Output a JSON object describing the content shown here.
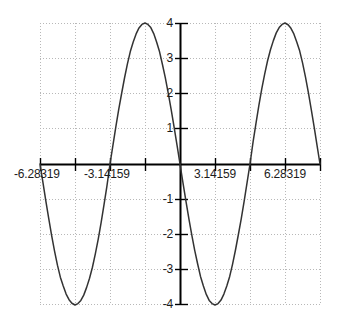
{
  "chart_data": {
    "type": "line",
    "title": "",
    "subtitle": "",
    "xlabel": "",
    "ylabel": "",
    "function": "y = -4 sin(x)",
    "xlim": [
      -6.28319,
      6.28319
    ],
    "ylim": [
      -4,
      4
    ],
    "grid": true,
    "grid_style": "dotted",
    "legend": "none",
    "x_tick_labels": [
      "-6.28319",
      "-3.14159",
      "3.14159",
      "6.28319"
    ],
    "x_tick_values": [
      -6.28319,
      -3.14159,
      3.14159,
      6.28319
    ],
    "x_gridline_values": [
      -6.28319,
      -4.712388,
      -3.14159,
      -1.570796,
      0,
      1.570796,
      3.14159,
      4.712388,
      6.28319
    ],
    "y_tick_labels": [
      "4",
      "3",
      "2",
      "1",
      "-1",
      "-2",
      "-3",
      "-4"
    ],
    "y_tick_values": [
      4,
      3,
      2,
      1,
      -1,
      -2,
      -3,
      -4
    ],
    "y_gridline_values": [
      4,
      3,
      2,
      1,
      0,
      -1,
      -2,
      -3,
      -4
    ],
    "series": [
      {
        "name": "-4 sin(x)",
        "color": "#333333",
        "points": [
          [
            -6.28319,
            0.0
          ],
          [
            -6.15,
            -0.53
          ],
          [
            -6.02,
            -1.05
          ],
          [
            -5.89,
            -1.55
          ],
          [
            -5.76,
            -2.03
          ],
          [
            -5.63,
            -2.47
          ],
          [
            -5.5,
            -2.87
          ],
          [
            -5.37,
            -3.21
          ],
          [
            -5.24,
            -3.46
          ],
          [
            -5.11,
            -3.69
          ],
          [
            -4.98,
            -3.85
          ],
          [
            -4.85,
            -3.95
          ],
          [
            -4.712388,
            -4.0
          ],
          [
            -4.58,
            -3.96
          ],
          [
            -4.45,
            -3.87
          ],
          [
            -4.32,
            -3.72
          ],
          [
            -4.19,
            -3.5
          ],
          [
            -4.06,
            -3.24
          ],
          [
            -3.93,
            -2.93
          ],
          [
            -3.8,
            -2.55
          ],
          [
            -3.67,
            -2.13
          ],
          [
            -3.54,
            -1.66
          ],
          [
            -3.41,
            -1.15
          ],
          [
            -3.28,
            -0.63
          ],
          [
            -3.14159,
            0.0
          ],
          [
            -3.01,
            0.53
          ],
          [
            -2.88,
            1.05
          ],
          [
            -2.75,
            1.55
          ],
          [
            -2.62,
            2.0
          ],
          [
            -2.49,
            2.44
          ],
          [
            -2.36,
            2.84
          ],
          [
            -2.23,
            3.19
          ],
          [
            -2.1,
            3.46
          ],
          [
            -1.97,
            3.69
          ],
          [
            -1.84,
            3.86
          ],
          [
            -1.71,
            3.96
          ],
          [
            -1.570796,
            4.0
          ],
          [
            -1.44,
            3.96
          ],
          [
            -1.31,
            3.87
          ],
          [
            -1.18,
            3.7
          ],
          [
            -1.05,
            3.46
          ],
          [
            -0.92,
            3.19
          ],
          [
            -0.79,
            2.83
          ],
          [
            -0.66,
            2.45
          ],
          [
            -0.53,
            2.02
          ],
          [
            -0.4,
            1.56
          ],
          [
            -0.27,
            1.07
          ],
          [
            -0.13,
            0.52
          ],
          [
            0.0,
            0.0
          ],
          [
            0.13,
            -0.52
          ],
          [
            0.27,
            -1.07
          ],
          [
            0.4,
            -1.56
          ],
          [
            0.53,
            -2.02
          ],
          [
            0.66,
            -2.45
          ],
          [
            0.79,
            -2.83
          ],
          [
            0.92,
            -3.19
          ],
          [
            1.05,
            -3.46
          ],
          [
            1.18,
            -3.7
          ],
          [
            1.31,
            -3.87
          ],
          [
            1.44,
            -3.96
          ],
          [
            1.570796,
            -4.0
          ],
          [
            1.71,
            -3.96
          ],
          [
            1.84,
            -3.86
          ],
          [
            1.97,
            -3.69
          ],
          [
            2.1,
            -3.46
          ],
          [
            2.23,
            -3.19
          ],
          [
            2.36,
            -2.84
          ],
          [
            2.49,
            -2.44
          ],
          [
            2.62,
            -2.0
          ],
          [
            2.75,
            -1.55
          ],
          [
            2.88,
            -1.05
          ],
          [
            3.01,
            -0.53
          ],
          [
            3.14159,
            0.0
          ],
          [
            3.28,
            0.63
          ],
          [
            3.41,
            1.15
          ],
          [
            3.54,
            1.66
          ],
          [
            3.67,
            2.13
          ],
          [
            3.8,
            2.55
          ],
          [
            3.93,
            2.93
          ],
          [
            4.06,
            3.24
          ],
          [
            4.19,
            3.5
          ],
          [
            4.32,
            3.72
          ],
          [
            4.45,
            3.87
          ],
          [
            4.58,
            3.96
          ],
          [
            4.712388,
            4.0
          ],
          [
            4.85,
            3.95
          ],
          [
            4.98,
            3.85
          ],
          [
            5.11,
            3.69
          ],
          [
            5.24,
            3.46
          ],
          [
            5.37,
            3.21
          ],
          [
            5.5,
            2.87
          ],
          [
            5.63,
            2.47
          ],
          [
            5.76,
            2.03
          ],
          [
            5.89,
            1.55
          ],
          [
            6.02,
            1.05
          ],
          [
            6.15,
            0.53
          ],
          [
            6.28319,
            0.0
          ]
        ]
      }
    ],
    "colors": {
      "curve": "#333333",
      "axis": "#000000",
      "grid": "#b8b8b8",
      "background": "#ffffff",
      "text": "#1c1c1c"
    }
  }
}
